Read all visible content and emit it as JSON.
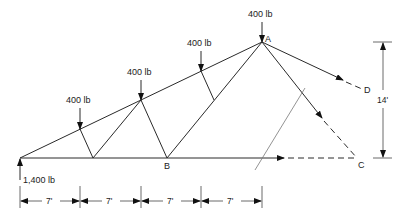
{
  "diagram": {
    "type": "truss-free-body",
    "loads": [
      {
        "label": "400 lb",
        "at": "top-chord-panel-1"
      },
      {
        "label": "400 lb",
        "at": "top-chord-panel-2"
      },
      {
        "label": "400 lb",
        "at": "top-chord-panel-3"
      },
      {
        "label": "400 lb",
        "at": "apex-A"
      }
    ],
    "reaction": {
      "label": "1,400 lb"
    },
    "nodes": {
      "A": "A",
      "B": "B",
      "C": "C",
      "D": "D"
    },
    "dimensions": {
      "spans": [
        "7'",
        "7'",
        "7'",
        "7'"
      ],
      "height": "14'"
    }
  }
}
